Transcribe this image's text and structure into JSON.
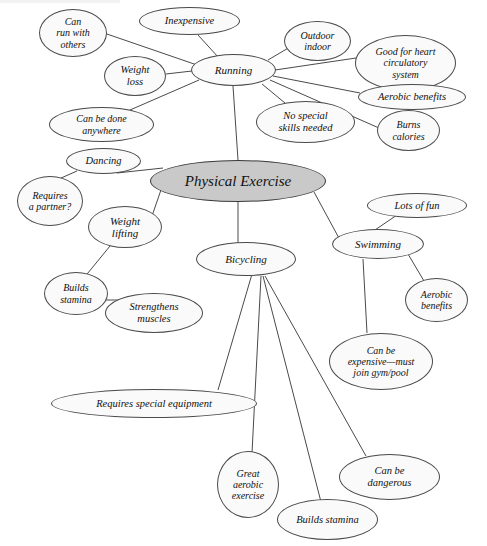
{
  "diagram": {
    "title": "Physical Exercise",
    "type": "mind-map",
    "style": {
      "center_fill": "#c9c9c9",
      "node_fill": "#fafafa",
      "stroke": "#4a4a4a",
      "text_color": "#111111",
      "background": "#ffffff"
    },
    "nodes": [
      {
        "id": "center",
        "label": "Physical Exercise",
        "kind": "center",
        "x": 150,
        "y": 160,
        "w": 176,
        "h": 42,
        "font": 15
      },
      {
        "id": "running",
        "label": "Running",
        "kind": "branch",
        "x": 191,
        "y": 54,
        "w": 85,
        "h": 32,
        "font": 11
      },
      {
        "id": "dancing",
        "label": "Dancing",
        "kind": "branch",
        "x": 66,
        "y": 148,
        "w": 75,
        "h": 26,
        "font": 10.5
      },
      {
        "id": "weight-lifting",
        "label": "Weight\nlifting",
        "kind": "branch",
        "x": 88,
        "y": 206,
        "w": 74,
        "h": 42,
        "font": 11
      },
      {
        "id": "bicycling",
        "label": "Bicycling",
        "kind": "branch",
        "x": 196,
        "y": 242,
        "w": 100,
        "h": 34,
        "font": 11
      },
      {
        "id": "swimming",
        "label": "Swimming",
        "kind": "branch",
        "x": 332,
        "y": 229,
        "w": 92,
        "h": 30,
        "font": 11
      },
      {
        "id": "can-run-with-others",
        "label": "Can\nrun with\nothers",
        "kind": "leaf",
        "x": 39,
        "y": 9,
        "w": 68,
        "h": 48,
        "font": 10
      },
      {
        "id": "inexpensive",
        "label": "Inexpensive",
        "kind": "leaf",
        "x": 139,
        "y": 7,
        "w": 101,
        "h": 28,
        "font": 10.5
      },
      {
        "id": "outdoor-indoor",
        "label": "Outdoor\nindoor",
        "kind": "leaf",
        "x": 284,
        "y": 21,
        "w": 67,
        "h": 40,
        "font": 10
      },
      {
        "id": "good-for-heart",
        "label": "Good for heart\ncirculatory\nsystem",
        "kind": "leaf",
        "x": 355,
        "y": 35,
        "w": 101,
        "h": 56,
        "font": 10
      },
      {
        "id": "weight-loss",
        "label": "Weight\nloss",
        "kind": "leaf",
        "x": 104,
        "y": 56,
        "w": 62,
        "h": 40,
        "font": 10.5
      },
      {
        "id": "aerobic-benefits-run",
        "label": "Aerobic benefits",
        "kind": "leaf",
        "x": 358,
        "y": 84,
        "w": 108,
        "h": 26,
        "font": 10.5
      },
      {
        "id": "can-be-done-anywhere",
        "label": "Can be done\nanywhere",
        "kind": "leaf",
        "x": 49,
        "y": 107,
        "w": 105,
        "h": 35,
        "font": 10
      },
      {
        "id": "no-special-skills",
        "label": "No special\nskills needed",
        "kind": "leaf",
        "x": 256,
        "y": 101,
        "w": 99,
        "h": 42,
        "font": 10.5
      },
      {
        "id": "burns-calories",
        "label": "Burns\ncalories",
        "kind": "leaf",
        "x": 377,
        "y": 110,
        "w": 63,
        "h": 41,
        "font": 10
      },
      {
        "id": "requires-partner",
        "label": "Requires\na partner?",
        "kind": "leaf",
        "x": 17,
        "y": 176,
        "w": 66,
        "h": 50,
        "font": 10
      },
      {
        "id": "lots-of-fun",
        "label": "Lots of fun",
        "kind": "leaf",
        "x": 367,
        "y": 193,
        "w": 100,
        "h": 25,
        "font": 10.5
      },
      {
        "id": "builds-stamina-wl",
        "label": "Builds\nstamina",
        "kind": "leaf",
        "x": 44,
        "y": 272,
        "w": 64,
        "h": 43,
        "font": 10
      },
      {
        "id": "strengthens-muscles",
        "label": "Strengthens\nmuscles",
        "kind": "leaf",
        "x": 105,
        "y": 293,
        "w": 98,
        "h": 40,
        "font": 10.5
      },
      {
        "id": "aerobic-benefits-sw",
        "label": "Aerobic\nbenefits",
        "kind": "leaf",
        "x": 405,
        "y": 278,
        "w": 63,
        "h": 44,
        "font": 10
      },
      {
        "id": "can-be-expensive",
        "label": "Can be\nexpensive—must\njoin gym/pool",
        "kind": "leaf",
        "x": 329,
        "y": 333,
        "w": 104,
        "h": 57,
        "font": 10
      },
      {
        "id": "requires-equipment",
        "label": "Requires special equipment",
        "kind": "leaf",
        "x": 51,
        "y": 389,
        "w": 206,
        "h": 29,
        "font": 10.5
      },
      {
        "id": "great-aerobic",
        "label": "Great\naerobic\nexercise",
        "kind": "leaf",
        "x": 217,
        "y": 451,
        "w": 62,
        "h": 67,
        "font": 10
      },
      {
        "id": "can-be-dangerous",
        "label": "Can be\ndangerous",
        "kind": "leaf",
        "x": 339,
        "y": 454,
        "w": 101,
        "h": 46,
        "font": 10.5
      },
      {
        "id": "builds-stamina-bike",
        "label": "Builds stamina",
        "kind": "leaf",
        "x": 277,
        "y": 499,
        "w": 101,
        "h": 41,
        "font": 10.5
      }
    ],
    "edges": [
      {
        "from": "center",
        "to": "running",
        "x1": 238,
        "y1": 160,
        "x2": 233,
        "y2": 86
      },
      {
        "from": "center",
        "to": "dancing",
        "x1": 163,
        "y1": 168,
        "x2": 117,
        "y2": 173
      },
      {
        "from": "center",
        "to": "weight-lifting",
        "x1": 163,
        "y1": 184,
        "x2": 152,
        "y2": 216
      },
      {
        "from": "center",
        "to": "bicycling",
        "x1": 238,
        "y1": 202,
        "x2": 238,
        "y2": 243
      },
      {
        "from": "center",
        "to": "swimming",
        "x1": 314,
        "y1": 192,
        "x2": 340,
        "y2": 240
      },
      {
        "from": "running",
        "to": "can-run-with-others",
        "x1": 200,
        "y1": 66,
        "x2": 104,
        "y2": 33
      },
      {
        "from": "running",
        "to": "inexpensive",
        "x1": 219,
        "y1": 58,
        "x2": 198,
        "y2": 35
      },
      {
        "from": "running",
        "to": "weight-loss",
        "x1": 192,
        "y1": 71,
        "x2": 166,
        "y2": 74
      },
      {
        "from": "running",
        "to": "outdoor-indoor",
        "x1": 268,
        "y1": 60,
        "x2": 290,
        "y2": 47
      },
      {
        "from": "running",
        "to": "good-for-heart",
        "x1": 275,
        "y1": 70,
        "x2": 356,
        "y2": 58
      },
      {
        "from": "running",
        "to": "aerobic-benefits-run",
        "x1": 273,
        "y1": 76,
        "x2": 360,
        "y2": 93
      },
      {
        "from": "running",
        "to": "can-be-done-anywhere",
        "x1": 199,
        "y1": 80,
        "x2": 130,
        "y2": 110
      },
      {
        "from": "running",
        "to": "no-special-skills",
        "x1": 262,
        "y1": 84,
        "x2": 285,
        "y2": 103
      },
      {
        "from": "running",
        "to": "burns-calories",
        "x1": 270,
        "y1": 80,
        "x2": 379,
        "y2": 128
      },
      {
        "from": "dancing",
        "to": "requires-partner",
        "x1": 77,
        "y1": 171,
        "x2": 52,
        "y2": 182
      },
      {
        "from": "weight-lifting",
        "to": "builds-stamina-wl",
        "x1": 110,
        "y1": 246,
        "x2": 83,
        "y2": 279
      },
      {
        "from": "builds-stamina-wl",
        "to": "strengthens-muscles",
        "x1": 100,
        "y1": 300,
        "x2": 122,
        "y2": 300
      },
      {
        "from": "swimming",
        "to": "lots-of-fun",
        "x1": 372,
        "y1": 232,
        "x2": 397,
        "y2": 215
      },
      {
        "from": "swimming",
        "to": "aerobic-benefits-sw",
        "x1": 408,
        "y1": 254,
        "x2": 424,
        "y2": 281
      },
      {
        "from": "swimming",
        "to": "can-be-expensive",
        "x1": 363,
        "y1": 259,
        "x2": 367,
        "y2": 333
      },
      {
        "from": "bicycling",
        "to": "requires-equipment",
        "x1": 252,
        "y1": 274,
        "x2": 218,
        "y2": 390
      },
      {
        "from": "bicycling",
        "to": "great-aerobic",
        "x1": 261,
        "y1": 276,
        "x2": 252,
        "y2": 453
      },
      {
        "from": "bicycling",
        "to": "builds-stamina-bike",
        "x1": 263,
        "y1": 276,
        "x2": 321,
        "y2": 502
      },
      {
        "from": "bicycling",
        "to": "can-be-dangerous",
        "x1": 265,
        "y1": 276,
        "x2": 366,
        "y2": 456
      }
    ]
  }
}
